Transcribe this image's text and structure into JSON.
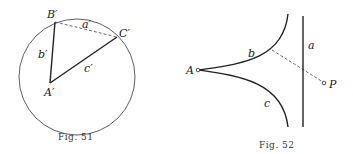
{
  "fig51": {
    "caption": "Fig. 51",
    "labels": {
      "B": "B′",
      "C": "C′",
      "A": "A′",
      "a": "a′",
      "b": "b′",
      "c": "c′"
    }
  },
  "fig52": {
    "caption": "Fig. 52",
    "labels": {
      "A": "A",
      "P": "P",
      "a": "a",
      "b": "b",
      "c": "c"
    }
  },
  "colors": {
    "ink": "#222222",
    "paper": "#ffffff"
  }
}
